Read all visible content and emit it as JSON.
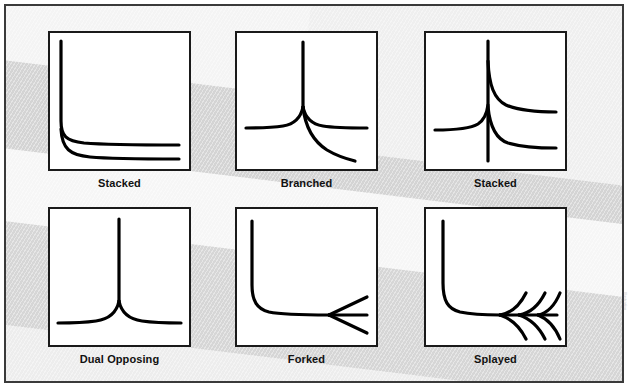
{
  "figure": {
    "background_color": "#e2e2e2",
    "border_color": "#3a3a3a",
    "panel_fill": "#ffffff",
    "panel_border_color": "#1a1a1a",
    "stroke_color": "#000000",
    "credit_text": "Illustration"
  },
  "panels": [
    {
      "id": "panel-stacked-1",
      "label": "Stacked",
      "pattern": "stacked",
      "description": "Vertical trunk at left with two hyperbolic curves flattening to horizontal at two different heights"
    },
    {
      "id": "panel-branched",
      "label": "Branched",
      "pattern": "branched",
      "description": "Vertical trunk descending to a junction that splits into a left horizontal branch, a right horizontal branch and a downward-right curving branch"
    },
    {
      "id": "panel-stacked-2",
      "label": "Stacked",
      "pattern": "stacked-through",
      "description": "Full-height vertical line through centre with a left horizontal curve entering and two right-going curves flattening at two heights"
    },
    {
      "id": "panel-dual-opposing",
      "label": "Dual Opposing",
      "pattern": "dual-opposing",
      "description": "Symmetric vertical trunk descending into a cusp that splits into mirrored left and right horizontal branches"
    },
    {
      "id": "panel-forked",
      "label": "Forked",
      "pattern": "forked",
      "description": "L-shaped curve bending from vertical at top-left to horizontal, then forking into three diverging straight branches at the right"
    },
    {
      "id": "panel-splayed",
      "label": "Splayed",
      "pattern": "splayed",
      "description": "L-shaped curve bending to horizontal then splaying into three pairs of curved branches above and below the axis, fishbone-like"
    }
  ]
}
